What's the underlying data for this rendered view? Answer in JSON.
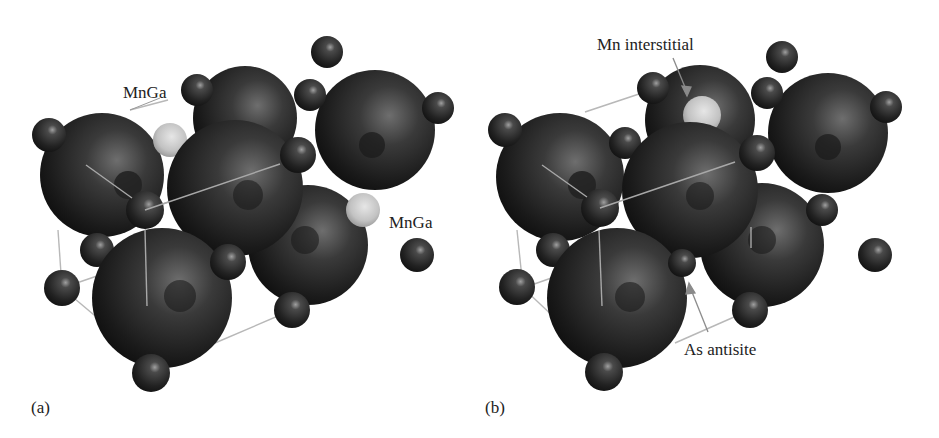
{
  "figure": {
    "panels": [
      {
        "tag": "(a)",
        "annotations": [
          {
            "text": "MnGa",
            "target": "upper-left light sphere"
          },
          {
            "text": "MnGa",
            "target": "right light sphere"
          }
        ]
      },
      {
        "tag": "(b)",
        "annotations": [
          {
            "text": "Mn interstitial",
            "target": "light sphere at top, arrowed"
          },
          {
            "text": "As antisite",
            "target": "small sphere between large spheres, arrowed"
          }
        ]
      }
    ],
    "colors": {
      "background": "#ffffff",
      "large_sphere": "#1c1c1c",
      "small_sphere": "#262626",
      "defect_sphere": "#c8c8c8",
      "cell_edges": "#b5b5b5",
      "text": "#222222"
    }
  }
}
